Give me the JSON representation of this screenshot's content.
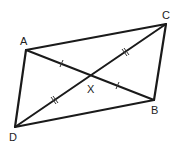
{
  "diagram": {
    "type": "parallelogram",
    "vertices": {
      "A": {
        "label": "A",
        "x": 26,
        "y": 50
      },
      "B": {
        "label": "B",
        "x": 154,
        "y": 100
      },
      "C": {
        "label": "C",
        "x": 166,
        "y": 24
      },
      "D": {
        "label": "D",
        "x": 15,
        "y": 127
      }
    },
    "intersection": {
      "label": "X",
      "x": 90,
      "y": 76
    },
    "edges": [
      "AC",
      "CB",
      "BD",
      "DA"
    ],
    "diagonals": [
      "AB",
      "DC"
    ],
    "tick_marks": [
      {
        "segment": "AX",
        "count": 1
      },
      {
        "segment": "XB",
        "count": 1
      },
      {
        "segment": "DX",
        "count": 2
      },
      {
        "segment": "XC",
        "count": 2
      }
    ],
    "colors": {
      "stroke": "#1a1a1a",
      "background": "#ffffff"
    }
  }
}
